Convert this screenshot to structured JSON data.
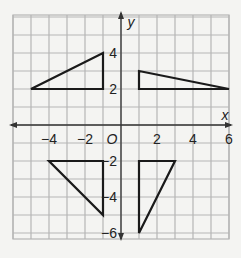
{
  "diagram": {
    "type": "coordinate-grid",
    "x_range": [
      -6,
      6
    ],
    "y_range": [
      -6,
      6
    ],
    "axis_labels": {
      "x": "x",
      "y": "y",
      "origin": "O"
    },
    "x_ticks": [
      {
        "value": -4,
        "label": "−4"
      },
      {
        "value": -2,
        "label": "−2"
      },
      {
        "value": 2,
        "label": "2"
      },
      {
        "value": 4,
        "label": "4"
      },
      {
        "value": 6,
        "label": "6"
      }
    ],
    "y_ticks": [
      {
        "value": 4,
        "label": "4"
      },
      {
        "value": 2,
        "label": "2"
      },
      {
        "value": -2,
        "label": "−2"
      },
      {
        "value": -4,
        "label": "−4"
      },
      {
        "value": -6,
        "label": "−6"
      }
    ],
    "triangles": [
      {
        "name": "triangle-q2",
        "points": [
          [
            -5,
            2
          ],
          [
            -1,
            4
          ],
          [
            -1,
            2
          ]
        ]
      },
      {
        "name": "triangle-q1",
        "points": [
          [
            1,
            3
          ],
          [
            1,
            2
          ],
          [
            6,
            2
          ]
        ]
      },
      {
        "name": "triangle-q3",
        "points": [
          [
            -4,
            -2
          ],
          [
            -1,
            -2
          ],
          [
            -1,
            -5
          ]
        ]
      },
      {
        "name": "triangle-q4",
        "points": [
          [
            1,
            -2
          ],
          [
            3,
            -2
          ],
          [
            1,
            -6
          ]
        ]
      }
    ],
    "colors": {
      "grid": "#b5b5b5",
      "axis": "#333333",
      "shape": "#1a1a1a",
      "background": "#f4f4f2"
    }
  }
}
